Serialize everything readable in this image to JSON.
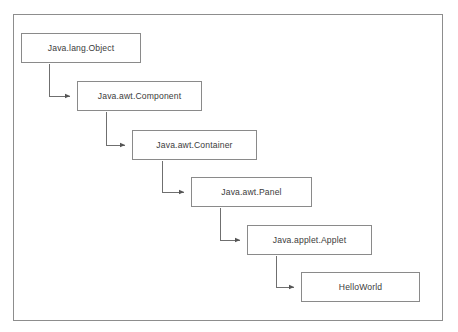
{
  "diagram": {
    "title_fragment": "",
    "type": "class-hierarchy-flowchart",
    "frame": {
      "x": 13,
      "y": 14,
      "width": 430,
      "height": 307
    },
    "colors": {
      "background": "#ffffff",
      "box_border": "#8a8a8a",
      "frame_border": "#8d8d8d",
      "text": "#3b3b3b",
      "connector": "#6f6f6f"
    },
    "nodes": [
      {
        "id": "node-1",
        "label": "Java.lang.Object",
        "x": 21,
        "y": 33,
        "width": 120,
        "height": 30
      },
      {
        "id": "node-2",
        "label": "Java.awt.Component",
        "x": 77,
        "y": 81,
        "width": 125,
        "height": 30
      },
      {
        "id": "node-3",
        "label": "Java.awt.Container",
        "x": 132,
        "y": 130,
        "width": 125,
        "height": 30
      },
      {
        "id": "node-4",
        "label": "Java.awt.Panel",
        "x": 191,
        "y": 177,
        "width": 121,
        "height": 30
      },
      {
        "id": "node-5",
        "label": "Java.applet.Applet",
        "x": 247,
        "y": 225,
        "width": 125,
        "height": 30
      },
      {
        "id": "node-6",
        "label": "HelloWorld",
        "x": 301,
        "y": 272,
        "width": 119,
        "height": 30
      }
    ],
    "edges": [
      {
        "id": "edge-1",
        "from": "Java.lang.Object",
        "to": "Java.awt.Component",
        "kind": "elbow-arrow"
      },
      {
        "id": "edge-2",
        "from": "Java.awt.Component",
        "to": "Java.awt.Container",
        "kind": "elbow-arrow"
      },
      {
        "id": "edge-3",
        "from": "Java.awt.Container",
        "to": "Java.awt.Panel",
        "kind": "elbow-arrow"
      },
      {
        "id": "edge-4",
        "from": "Java.awt.Panel",
        "to": "Java.applet.Applet",
        "kind": "elbow-arrow"
      },
      {
        "id": "edge-5",
        "from": "Java.applet.Applet",
        "to": "HelloWorld",
        "kind": "elbow-arrow"
      }
    ]
  }
}
